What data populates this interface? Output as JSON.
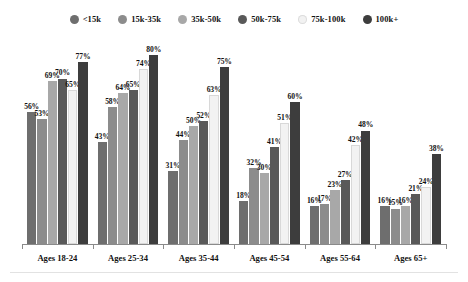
{
  "legend": {
    "position": "top-center",
    "entries": [
      {
        "label": "<15k",
        "color": "#6e6e6e",
        "icon": "legend-dot-icon"
      },
      {
        "label": "15k-35k",
        "color": "#8c8c8c",
        "icon": "legend-dot-icon"
      },
      {
        "label": "35k-50k",
        "color": "#a8a8a8",
        "icon": "legend-dot-icon"
      },
      {
        "label": "50k-75k",
        "color": "#595959",
        "icon": "legend-dot-icon"
      },
      {
        "label": "75k-100k",
        "color": "#f2f2f2",
        "icon": "legend-dot-icon"
      },
      {
        "label": "100k+",
        "color": "#3d3d3d",
        "icon": "legend-dot-icon"
      }
    ]
  },
  "chart_data": {
    "type": "bar",
    "title": "",
    "subtitle": "",
    "xlabel": "",
    "ylabel": "",
    "ylim": [
      0,
      88
    ],
    "grid": false,
    "value_suffix": "%",
    "legend_position": "top-center",
    "categories": [
      "Ages 18-24",
      "Ages 25-34",
      "Ages 35-44",
      "Ages 45-54",
      "Ages 55-64",
      "Ages 65+"
    ],
    "series": [
      {
        "name": "<15k",
        "color": "#6e6e6e",
        "values": [
          56,
          43,
          31,
          18,
          16,
          16
        ]
      },
      {
        "name": "15k-35k",
        "color": "#8c8c8c",
        "values": [
          53,
          58,
          44,
          32,
          17,
          15
        ]
      },
      {
        "name": "35k-50k",
        "color": "#a8a8a8",
        "values": [
          69,
          64,
          50,
          30,
          23,
          16
        ]
      },
      {
        "name": "50k-75k",
        "color": "#595959",
        "values": [
          70,
          65,
          52,
          41,
          27,
          21
        ]
      },
      {
        "name": "75k-100k",
        "color": "#f2f2f2",
        "values": [
          65,
          74,
          63,
          51,
          42,
          24
        ]
      },
      {
        "name": "100k+",
        "color": "#3d3d3d",
        "values": [
          77,
          80,
          75,
          60,
          48,
          38
        ]
      }
    ],
    "labels": [
      [
        "56%",
        "53%",
        "69%",
        "70%",
        "65%",
        "77%"
      ],
      [
        "43%",
        "58%",
        "64%",
        "65%",
        "74%",
        "80%"
      ],
      [
        "31%",
        "44%",
        "50%",
        "52%",
        "63%",
        "75%"
      ],
      [
        "18%",
        "32%",
        "30%",
        "41%",
        "51%",
        "60%"
      ],
      [
        "16%",
        "17%",
        "23%",
        "27%",
        "42%",
        "48%"
      ],
      [
        "16%",
        "15%",
        "16%",
        "21%",
        "24%",
        "38%"
      ]
    ]
  },
  "axis": {
    "line_color": "#8a8a8a",
    "tick_count": 7
  }
}
